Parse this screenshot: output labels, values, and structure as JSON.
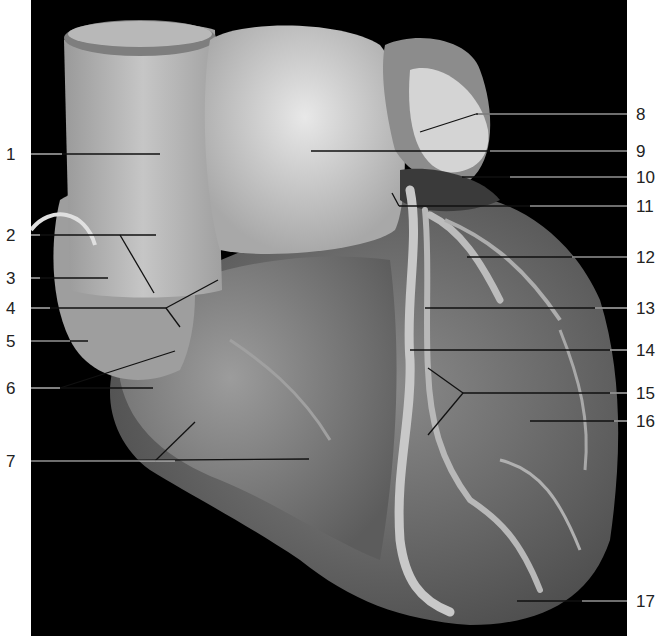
{
  "figure": {
    "background_color": "#000000",
    "page_color": "#ffffff",
    "label_color": "#222222"
  },
  "labels_left": [
    {
      "num": "1",
      "y": 154,
      "line_end": [
        160,
        154
      ]
    },
    {
      "num": "2",
      "y": 235,
      "line_end": [
        156,
        235
      ]
    },
    {
      "num": "3",
      "y": 278,
      "line_end": [
        108,
        278
      ]
    },
    {
      "num": "4",
      "y": 308,
      "line_end": [
        166,
        308
      ]
    },
    {
      "num": "5",
      "y": 341,
      "line_end": [
        88,
        341
      ]
    },
    {
      "num": "6",
      "y": 388,
      "line_end": [
        153,
        388
      ]
    },
    {
      "num": "7",
      "y": 461,
      "line_end": [
        309,
        459
      ]
    }
  ],
  "labels_right": [
    {
      "num": "8",
      "y": 114,
      "line_start": [
        476,
        114
      ]
    },
    {
      "num": "9",
      "y": 151,
      "line_start": [
        311,
        151
      ]
    },
    {
      "num": "10",
      "y": 177,
      "line_start": [
        462,
        177
      ]
    },
    {
      "num": "11",
      "y": 206,
      "line_start": [
        399,
        206
      ]
    },
    {
      "num": "12",
      "y": 257,
      "line_start": [
        467,
        257
      ]
    },
    {
      "num": "13",
      "y": 308,
      "line_start": [
        425,
        308
      ]
    },
    {
      "num": "14",
      "y": 350,
      "line_start": [
        410,
        350
      ]
    },
    {
      "num": "15",
      "y": 393,
      "line_start": [
        463,
        393
      ]
    },
    {
      "num": "16",
      "y": 421,
      "line_start": [
        530,
        421
      ]
    },
    {
      "num": "17",
      "y": 601,
      "line_start": [
        517,
        601
      ]
    }
  ]
}
